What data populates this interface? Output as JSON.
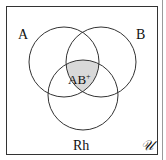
{
  "diagram": {
    "type": "venn",
    "sets": [
      {
        "id": "A",
        "label": "A"
      },
      {
        "id": "B",
        "label": "B"
      },
      {
        "id": "Rh",
        "label": "Rh"
      }
    ],
    "universe_label": "𝒰",
    "shaded_region": {
      "sets": [
        "A",
        "B",
        "Rh"
      ],
      "label_main": "AB",
      "label_sup": "+"
    },
    "colors": {
      "stroke": "#333333",
      "shade": "#d9d9d9",
      "background": "#ffffff"
    }
  }
}
